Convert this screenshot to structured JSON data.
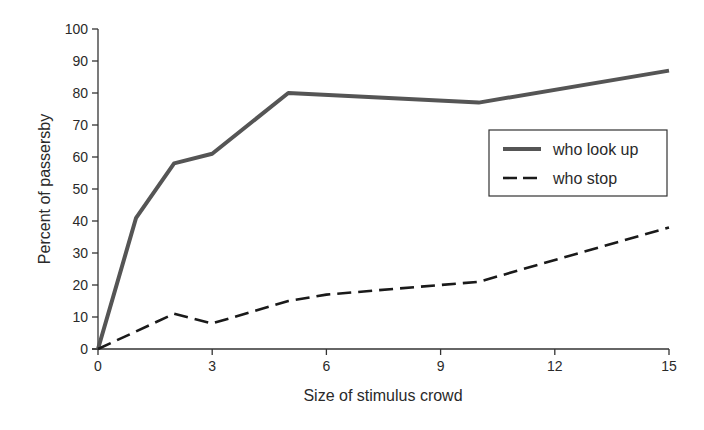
{
  "chart_data": {
    "type": "line",
    "title": "",
    "xlabel": "Size of stimulus crowd",
    "ylabel": "Percent of passersby",
    "xlim": [
      0,
      15
    ],
    "ylim": [
      0,
      100
    ],
    "xticks": [
      0,
      3,
      6,
      9,
      12,
      15
    ],
    "yticks": [
      0,
      10,
      20,
      30,
      40,
      50,
      60,
      70,
      80,
      90,
      100
    ],
    "grid": false,
    "legend_position": "right-middle (inside plot)",
    "series": [
      {
        "name": "who look up",
        "style": "solid",
        "color": "#555555",
        "x": [
          0,
          1,
          2,
          3,
          5,
          10,
          15
        ],
        "values": [
          0,
          41,
          58,
          61,
          80,
          77,
          87
        ]
      },
      {
        "name": "who stop",
        "style": "dashed",
        "color": "#1a1a1a",
        "x": [
          0,
          2,
          3,
          5,
          6,
          10,
          15
        ],
        "values": [
          0,
          11,
          8,
          15,
          17,
          21,
          38
        ]
      }
    ]
  },
  "legend": {
    "items": [
      {
        "label": "who look up"
      },
      {
        "label": "who stop"
      }
    ]
  }
}
